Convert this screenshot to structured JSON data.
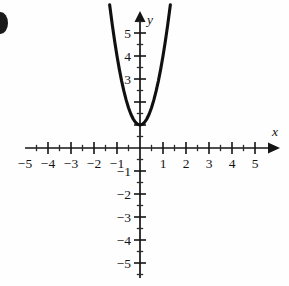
{
  "figure": {
    "title": "",
    "marker_label": "",
    "background_color": "#fefefe",
    "ink_color": "#141414"
  },
  "chart_data": {
    "type": "line",
    "title": "",
    "subtitle": "",
    "xlabel": "x",
    "ylabel": "y",
    "xlim": [
      -5.6,
      5.6
    ],
    "ylim": [
      -5.6,
      5.9
    ],
    "grid": false,
    "legend": null,
    "axis_style": "cartesian-arrows",
    "origin_px": [
      140,
      148
    ],
    "unit_px": 23,
    "x_ticks_major": [
      -5,
      -4,
      -3,
      -2,
      -1,
      1,
      2,
      3,
      4,
      5
    ],
    "x_tick_labels": [
      "-5",
      "-4",
      "-3",
      "-2",
      "-1",
      "1",
      "2",
      "3",
      "4",
      "5"
    ],
    "y_ticks_major": [
      5,
      4,
      3,
      2,
      1,
      -1,
      -2,
      -3,
      -4,
      -5
    ],
    "y_tick_labels": [
      "5",
      "4",
      "3",
      "",
      "",
      "-1",
      "-2",
      "-3",
      "-4",
      "-5"
    ],
    "minor_tick_step": 0.5,
    "series": [
      {
        "name": "parabola",
        "kind": "parabola",
        "equation": "y = 3x^2 + 1",
        "vertex": [
          0,
          1
        ],
        "leading_coefficient": 3,
        "opens": "up",
        "x": [
          -1.32,
          -1.2,
          -1.1,
          -1.0,
          -0.9,
          -0.8,
          -0.7,
          -0.6,
          -0.5,
          -0.4,
          -0.3,
          -0.2,
          -0.1,
          0,
          0.1,
          0.2,
          0.3,
          0.4,
          0.5,
          0.6,
          0.7,
          0.8,
          0.9,
          1.0,
          1.1,
          1.2,
          1.32
        ],
        "values": [
          6.23,
          5.32,
          4.63,
          4.0,
          3.43,
          2.92,
          2.47,
          2.08,
          1.75,
          1.48,
          1.27,
          1.12,
          1.03,
          1.0,
          1.03,
          1.12,
          1.27,
          1.48,
          1.75,
          2.08,
          2.47,
          2.92,
          3.43,
          4.0,
          4.63,
          5.32,
          6.23
        ]
      }
    ],
    "annotations": []
  }
}
